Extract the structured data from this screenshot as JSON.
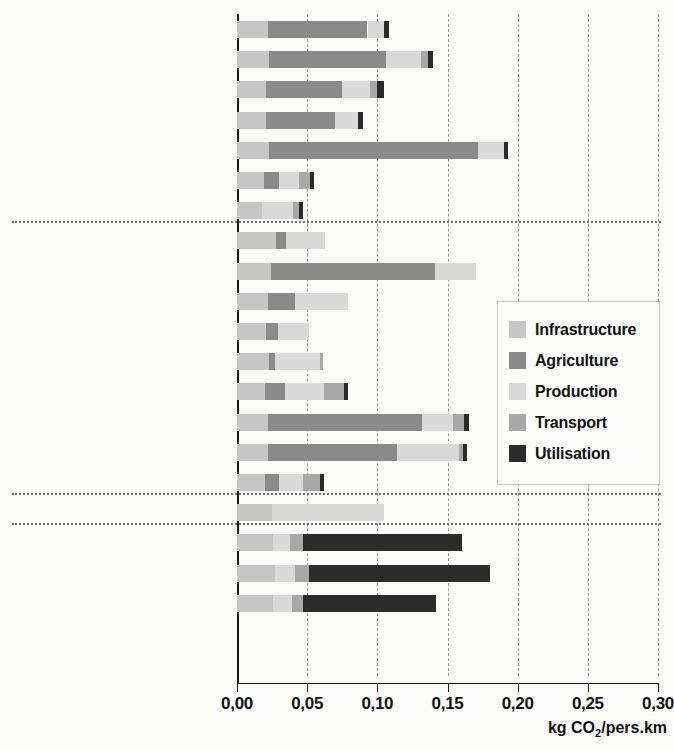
{
  "chart_data": {
    "type": "bar",
    "orientation": "horizontal",
    "stacked": true,
    "title": "",
    "xlabel": "kg CO2/pers.km",
    "xlabel_rich": "kg CO₂/pers.km",
    "ylabel": "",
    "xlim": [
      0.0,
      0.3
    ],
    "grid": true,
    "grid_axis": "x",
    "legend_position": "center-right",
    "tick_labels": [
      "0,00",
      "0,05",
      "0,10",
      "0,15",
      "0,20",
      "0,25",
      "0,30"
    ],
    "tick_values": [
      0.0,
      0.05,
      0.1,
      0.15,
      0.2,
      0.25,
      0.3
    ],
    "series": [
      {
        "name": "Infrastructure",
        "color": "#c6c6c6"
      },
      {
        "name": "Agriculture",
        "color": "#8a8a8a"
      },
      {
        "name": "Production",
        "color": "#d9d9d9"
      },
      {
        "name": "Transport",
        "color": "#a8a8a8"
      },
      {
        "name": "Utilisation",
        "color": "#2b2b2b"
      }
    ],
    "groups": [
      {
        "name": "Biodiesel",
        "count": 7
      },
      {
        "name": "Bioéthanol",
        "count": 9
      },
      {
        "name": "Biogaz",
        "count": 1
      },
      {
        "name": "Fossiles",
        "count": 3
      }
    ],
    "categories": [
      "Biodiesel, colza, CH",
      "Biodiesel, colza, EU",
      "Biodiesel, palmier à huile, MY",
      "Biodiesel, soja, US",
      "Biodiesel, soja, BR",
      "Biodiesel, huiles usagées, CH",
      "Biodiesel, huiles usagées, FR",
      "Bioéthanol, herbe, CH",
      "Bioéthanol, pommes de terre, CH",
      "Bioéthanol, betteraves, CH",
      "Bioéthanol, petit-lait, CH",
      "Bioéthanol, bois, CH",
      "Bioéthanol, sorgho, CN",
      "Bioéthanol, céréales, EU",
      "Bioéthanol, maïs, US",
      "Bioéthanol, canne à sucre, BR",
      "Biogaz moyenne, CH",
      "Diesel, CH",
      "Essence, CH",
      "Gaz naturel, CH"
    ],
    "values": {
      "Infrastructure": [
        0.022,
        0.023,
        0.021,
        0.021,
        0.023,
        0.019,
        0.018,
        0.028,
        0.024,
        0.022,
        0.021,
        0.023,
        0.02,
        0.022,
        0.022,
        0.02,
        0.025,
        0.026,
        0.027,
        0.026
      ],
      "Agriculture": [
        0.071,
        0.083,
        0.054,
        0.049,
        0.149,
        0.011,
        0.0,
        0.007,
        0.117,
        0.019,
        0.008,
        0.004,
        0.014,
        0.11,
        0.092,
        0.01,
        0.0,
        0.0,
        0.0,
        0.0
      ],
      "Production": [
        0.012,
        0.025,
        0.02,
        0.016,
        0.018,
        0.014,
        0.022,
        0.028,
        0.029,
        0.038,
        0.022,
        0.032,
        0.028,
        0.022,
        0.044,
        0.017,
        0.08,
        0.012,
        0.014,
        0.013
      ],
      "Transport": [
        0.0,
        0.005,
        0.005,
        0.0,
        0.0,
        0.008,
        0.004,
        0.0,
        0.0,
        0.0,
        0.0,
        0.002,
        0.014,
        0.008,
        0.003,
        0.012,
        0.0,
        0.009,
        0.01,
        0.008
      ],
      "Utilisation": [
        0.003,
        0.004,
        0.005,
        0.004,
        0.003,
        0.003,
        0.003,
        0.0,
        0.0,
        0.0,
        0.0,
        0.0,
        0.003,
        0.003,
        0.003,
        0.003,
        0.0,
        0.113,
        0.129,
        0.095
      ]
    },
    "totals": [
      0.108,
      0.14,
      0.105,
      0.09,
      0.193,
      0.055,
      0.047,
      0.063,
      0.17,
      0.079,
      0.051,
      0.061,
      0.079,
      0.165,
      0.164,
      0.062,
      0.105,
      0.16,
      0.18,
      0.142
    ]
  },
  "legend": {
    "items": [
      {
        "label": "Infrastructure",
        "color": "#c6c6c6"
      },
      {
        "label": "Agriculture",
        "color": "#8a8a8a"
      },
      {
        "label": "Production",
        "color": "#d9d9d9"
      },
      {
        "label": "Transport",
        "color": "#a8a8a8"
      },
      {
        "label": "Utilisation",
        "color": "#2b2b2b"
      }
    ]
  },
  "axis": {
    "title_prefix": "kg CO",
    "title_sub": "2",
    "title_suffix": "/pers.km"
  }
}
